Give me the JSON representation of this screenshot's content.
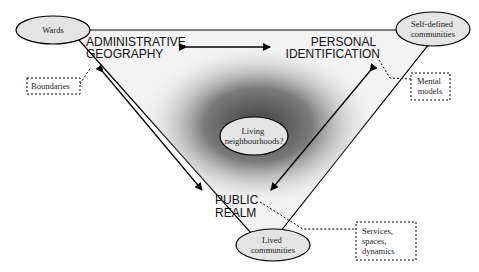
{
  "diagram": {
    "corners": {
      "top_left": {
        "label_line1": "ADMINISTRATIVE",
        "label_line2": "GEOGRAPHY",
        "ellipse": "Wards",
        "note": "Boundaries"
      },
      "top_right": {
        "label_line1": "PERSONAL",
        "label_line2": "IDENTIFICATION",
        "ellipse_line1": "Self-defined",
        "ellipse_line2": "communities",
        "note_line1": "Mental",
        "note_line2": "models"
      },
      "bottom": {
        "label_line1": "PUBLIC",
        "label_line2": "REALM",
        "ellipse_line1": "Lived",
        "ellipse_line2": "communities",
        "note_line1": "Services,",
        "note_line2": "spaces,",
        "note_line3": "dynamics"
      }
    },
    "center": {
      "line1": "Living",
      "line2": "neighbourhoods?"
    },
    "colors": {
      "ellipse_fill": "#e4e4e4",
      "stroke": "#000000",
      "triangle_fill": "#f2f2f2",
      "gradient_dark": "#5a5a5a"
    }
  }
}
